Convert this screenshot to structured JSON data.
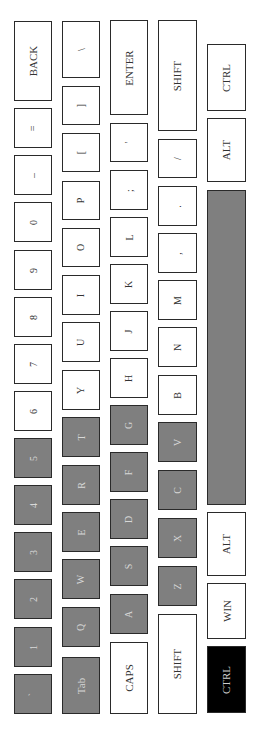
{
  "keyboard": {
    "orientation": "rotated-90-ccw",
    "colors": {
      "key_default": "#ffffff",
      "key_highlight": "#7f7f7f",
      "key_active": "#000000",
      "border": "#2a2a2a"
    },
    "rows": [
      {
        "name": "number-row",
        "x": 14,
        "w": 38,
        "keys": [
          {
            "label": "BACK",
            "y": 21,
            "h": 80,
            "state": "normal"
          },
          {
            "label": "=",
            "y": 108,
            "h": 40,
            "state": "normal"
          },
          {
            "label": "–",
            "y": 155,
            "h": 40,
            "state": "normal"
          },
          {
            "label": "0",
            "y": 202,
            "h": 40,
            "state": "normal"
          },
          {
            "label": "9",
            "y": 250,
            "h": 40,
            "state": "normal"
          },
          {
            "label": "8",
            "y": 297,
            "h": 40,
            "state": "normal"
          },
          {
            "label": "7",
            "y": 344,
            "h": 40,
            "state": "normal"
          },
          {
            "label": "6",
            "y": 391,
            "h": 40,
            "state": "normal"
          },
          {
            "label": "5",
            "y": 438,
            "h": 40,
            "state": "highlighted"
          },
          {
            "label": "4",
            "y": 485,
            "h": 40,
            "state": "highlighted"
          },
          {
            "label": "3",
            "y": 532,
            "h": 40,
            "state": "highlighted"
          },
          {
            "label": "2",
            "y": 579,
            "h": 40,
            "state": "highlighted"
          },
          {
            "label": "1",
            "y": 627,
            "h": 40,
            "state": "highlighted"
          },
          {
            "label": "`",
            "y": 674,
            "h": 40,
            "state": "highlighted"
          }
        ]
      },
      {
        "name": "qwerty-row",
        "x": 62,
        "w": 38,
        "keys": [
          {
            "label": "\\",
            "y": 21,
            "h": 57,
            "state": "normal"
          },
          {
            "label": "]",
            "y": 86,
            "h": 39,
            "state": "normal"
          },
          {
            "label": "[",
            "y": 133,
            "h": 39,
            "state": "normal"
          },
          {
            "label": "P",
            "y": 181,
            "h": 39,
            "state": "normal"
          },
          {
            "label": "O",
            "y": 228,
            "h": 39,
            "state": "normal"
          },
          {
            "label": "I",
            "y": 275,
            "h": 40,
            "state": "normal"
          },
          {
            "label": "U",
            "y": 322,
            "h": 40,
            "state": "normal"
          },
          {
            "label": "Y",
            "y": 370,
            "h": 40,
            "state": "normal"
          },
          {
            "label": "T",
            "y": 417,
            "h": 40,
            "state": "highlighted"
          },
          {
            "label": "R",
            "y": 465,
            "h": 40,
            "state": "highlighted"
          },
          {
            "label": "E",
            "y": 512,
            "h": 40,
            "state": "highlighted"
          },
          {
            "label": "W",
            "y": 559,
            "h": 40,
            "state": "highlighted"
          },
          {
            "label": "Q",
            "y": 607,
            "h": 40,
            "state": "highlighted"
          },
          {
            "label": "Tab",
            "y": 657,
            "h": 57,
            "state": "highlighted"
          }
        ]
      },
      {
        "name": "home-row",
        "x": 110,
        "w": 38,
        "keys": [
          {
            "label": "ENTER",
            "y": 20,
            "h": 95,
            "state": "normal"
          },
          {
            "label": "'",
            "y": 123,
            "h": 39,
            "state": "normal"
          },
          {
            "label": ";",
            "y": 170,
            "h": 40,
            "state": "normal"
          },
          {
            "label": "L",
            "y": 217,
            "h": 40,
            "state": "normal"
          },
          {
            "label": "K",
            "y": 264,
            "h": 40,
            "state": "normal"
          },
          {
            "label": "J",
            "y": 311,
            "h": 40,
            "state": "normal"
          },
          {
            "label": "H",
            "y": 358,
            "h": 40,
            "state": "normal"
          },
          {
            "label": "G",
            "y": 405,
            "h": 40,
            "state": "highlighted"
          },
          {
            "label": "F",
            "y": 452,
            "h": 40,
            "state": "highlighted"
          },
          {
            "label": "D",
            "y": 499,
            "h": 40,
            "state": "highlighted"
          },
          {
            "label": "S",
            "y": 546,
            "h": 40,
            "state": "highlighted"
          },
          {
            "label": "A",
            "y": 594,
            "h": 40,
            "state": "highlighted"
          },
          {
            "label": "CAPS",
            "y": 642,
            "h": 72,
            "state": "normal"
          }
        ]
      },
      {
        "name": "shift-row",
        "x": 158,
        "w": 39,
        "keys": [
          {
            "label": "SHIFT",
            "y": 20,
            "h": 111,
            "state": "normal"
          },
          {
            "label": "/",
            "y": 139,
            "h": 39,
            "state": "normal"
          },
          {
            "label": ".",
            "y": 186,
            "h": 40,
            "state": "normal"
          },
          {
            "label": ",",
            "y": 233,
            "h": 40,
            "state": "normal"
          },
          {
            "label": "M",
            "y": 280,
            "h": 40,
            "state": "normal"
          },
          {
            "label": "N",
            "y": 327,
            "h": 40,
            "state": "normal"
          },
          {
            "label": "B",
            "y": 375,
            "h": 40,
            "state": "normal"
          },
          {
            "label": "V",
            "y": 422,
            "h": 40,
            "state": "highlighted"
          },
          {
            "label": "C",
            "y": 470,
            "h": 40,
            "state": "highlighted"
          },
          {
            "label": "X",
            "y": 518,
            "h": 40,
            "state": "highlighted"
          },
          {
            "label": "Z",
            "y": 566,
            "h": 40,
            "state": "highlighted"
          },
          {
            "label": "SHIFT",
            "y": 614,
            "h": 100,
            "state": "normal"
          }
        ]
      },
      {
        "name": "bottom-row",
        "x": 207,
        "w": 39,
        "keys": [
          {
            "label": "CTRL",
            "y": 44,
            "h": 67,
            "state": "normal"
          },
          {
            "label": "ALT",
            "y": 118,
            "h": 64,
            "state": "normal"
          },
          {
            "label": "",
            "y": 190,
            "h": 315,
            "state": "highlighted"
          },
          {
            "label": "ALT",
            "y": 512,
            "h": 64,
            "state": "normal"
          },
          {
            "label": "WIN",
            "y": 583,
            "h": 56,
            "state": "normal"
          },
          {
            "label": "CTRL",
            "y": 646,
            "h": 67,
            "state": "active"
          }
        ]
      }
    ]
  }
}
